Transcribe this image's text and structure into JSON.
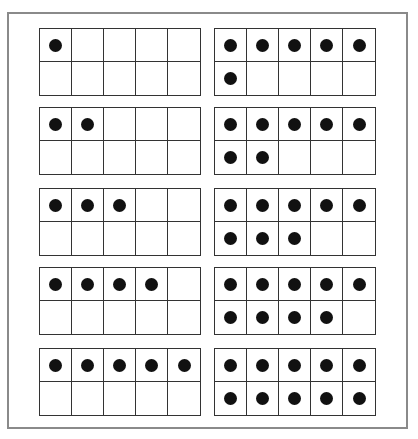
{
  "title": "",
  "frame_color": "#8a8a8a",
  "dot_color": "#111111",
  "ten_frames": [
    {
      "id": 1,
      "count": 1,
      "column": "left",
      "row": 0
    },
    {
      "id": 2,
      "count": 2,
      "column": "left",
      "row": 1
    },
    {
      "id": 3,
      "count": 3,
      "column": "left",
      "row": 2
    },
    {
      "id": 4,
      "count": 4,
      "column": "left",
      "row": 3
    },
    {
      "id": 5,
      "count": 5,
      "column": "left",
      "row": 4
    },
    {
      "id": 6,
      "count": 6,
      "column": "right",
      "row": 0
    },
    {
      "id": 7,
      "count": 7,
      "column": "right",
      "row": 1
    },
    {
      "id": 8,
      "count": 8,
      "column": "right",
      "row": 2
    },
    {
      "id": 9,
      "count": 9,
      "column": "right",
      "row": 3
    },
    {
      "id": 10,
      "count": 10,
      "column": "right",
      "row": 4
    }
  ]
}
